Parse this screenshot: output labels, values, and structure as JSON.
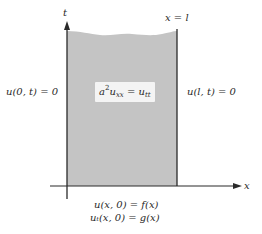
{
  "diagram": {
    "type": "pde-domain",
    "colors": {
      "region_fill": "#c4c4c4",
      "axis": "#2a2a2a",
      "text": "#2a2a2a",
      "background": "#ffffff"
    },
    "axes": {
      "horizontal_label": "x",
      "vertical_label": "t"
    },
    "boundaries": {
      "right_line_label": "x = l"
    },
    "equation": {
      "coef": "a",
      "coef_power": "2",
      "lhs_var": "u",
      "lhs_sub": "xx",
      "equals": " = ",
      "rhs_var": "u",
      "rhs_sub": "tt"
    },
    "boundary_conditions": {
      "left": "u(0, t) = 0",
      "right": "u(l, t) = 0"
    },
    "initial_conditions": [
      "u(x, 0) = f(x)",
      "uₜ(x, 0) = g(x)"
    ]
  }
}
